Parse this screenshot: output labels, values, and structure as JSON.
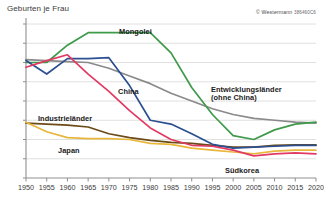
{
  "title": "Geburten je Frau",
  "credit": {
    "symbol": "© Westermann",
    "code": "386460C6"
  },
  "labels": {
    "mongolei": "Mongolei",
    "china": "China",
    "entwicklung_1": "Entwicklungsländer",
    "entwicklung_2": "(ohne China)",
    "industrie": "Industrieländer",
    "japan": "Japan",
    "suedkorea": "Südkorea"
  },
  "colors": {
    "mongolei": "#3f9a4a",
    "china": "#2b4f91",
    "entwicklung": "#8a8a8a",
    "industrie": "#6b4a18",
    "japan": "#e8b63a",
    "suedkorea": "#e23a63",
    "grid": "#d8d8d8",
    "axis": "#8f8f8f",
    "text": "#333333"
  },
  "chart_data": {
    "type": "line",
    "title": "Geburten je Frau",
    "xlabel": "",
    "ylabel": "Geburten je Frau",
    "xlim": [
      1950,
      2020
    ],
    "ylim": [
      0,
      8
    ],
    "yticks": [
      0,
      1,
      2,
      3,
      4,
      5,
      6,
      7,
      8
    ],
    "xticks": [
      1950,
      1955,
      1960,
      1965,
      1970,
      1975,
      1980,
      1985,
      1990,
      1995,
      2000,
      2005,
      2010,
      2015,
      2020
    ],
    "grid": true,
    "legend": "inline-labels",
    "x": [
      1950,
      1955,
      1960,
      1965,
      1970,
      1975,
      1980,
      1985,
      1990,
      1995,
      2000,
      2005,
      2010,
      2015,
      2020
    ],
    "series": [
      {
        "name": "Mongolei",
        "color": "#3f9a4a",
        "values": [
          6.0,
          6.0,
          6.9,
          7.55,
          7.55,
          7.55,
          7.55,
          6.5,
          4.7,
          3.3,
          2.2,
          2.0,
          2.5,
          2.8,
          2.9
        ]
      },
      {
        "name": "China",
        "color": "#2b4f91",
        "values": [
          6.1,
          5.4,
          6.2,
          6.2,
          6.25,
          4.8,
          3.0,
          2.8,
          2.3,
          1.75,
          1.55,
          1.6,
          1.65,
          1.7,
          1.7
        ]
      },
      {
        "name": "Entwicklungsländer (ohne China)",
        "color": "#8a8a8a",
        "values": [
          6.15,
          6.1,
          6.05,
          6.0,
          5.7,
          5.3,
          4.9,
          4.4,
          4.0,
          3.6,
          3.3,
          3.1,
          3.0,
          2.9,
          2.85
        ]
      },
      {
        "name": "Industrieländer",
        "color": "#6b4a18",
        "values": [
          2.85,
          2.8,
          2.75,
          2.65,
          2.3,
          2.1,
          1.95,
          1.85,
          1.8,
          1.7,
          1.6,
          1.6,
          1.7,
          1.72,
          1.72
        ]
      },
      {
        "name": "Japan",
        "color": "#e8b63a",
        "values": [
          2.9,
          2.4,
          2.1,
          2.05,
          2.05,
          2.0,
          1.8,
          1.75,
          1.55,
          1.45,
          1.35,
          1.26,
          1.4,
          1.45,
          1.45
        ]
      },
      {
        "name": "Südkorea",
        "color": "#e23a63",
        "values": [
          5.75,
          6.1,
          6.4,
          5.4,
          4.5,
          3.5,
          2.6,
          2.0,
          1.7,
          1.65,
          1.45,
          1.15,
          1.25,
          1.3,
          1.25
        ]
      }
    ]
  }
}
